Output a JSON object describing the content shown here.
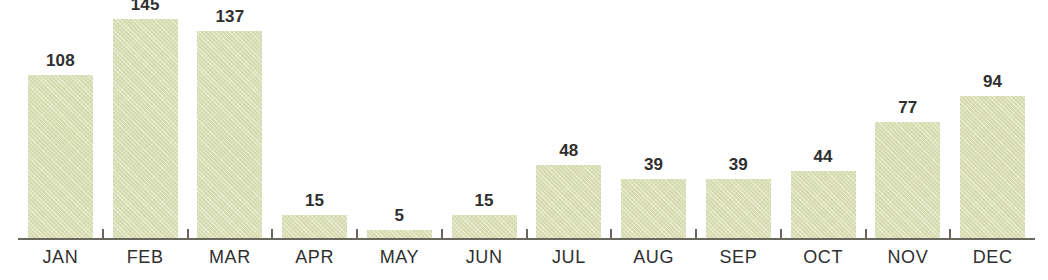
{
  "chart_data": {
    "type": "bar",
    "title": "",
    "subtitle": "",
    "xlabel": "",
    "ylabel": "",
    "categories": [
      "JAN",
      "FEB",
      "MAR",
      "APR",
      "MAY",
      "JUN",
      "JUL",
      "AUG",
      "SEP",
      "OCT",
      "NOV",
      "DEC"
    ],
    "values": [
      108,
      145,
      137,
      15,
      5,
      15,
      48,
      39,
      39,
      44,
      77,
      94
    ],
    "data_labels": [
      "108",
      "145",
      "137",
      "15",
      "5",
      "15",
      "48",
      "39",
      "39",
      "44",
      "77",
      "94"
    ],
    "ylim": [
      0,
      152
    ],
    "grid": false,
    "legend": null,
    "legend_position": "none",
    "axis": {
      "x_axis_visible": true,
      "y_axis_visible": false,
      "tick_marks": "between-categories",
      "tick_count": 11
    },
    "annotations": []
  },
  "style": {
    "bar_fill": "#dde2b7",
    "bar_texture": "diagonal-paper-weave",
    "axis_color": "#6a675f",
    "text_color": "#2f2f30",
    "background": "#ffffff"
  }
}
